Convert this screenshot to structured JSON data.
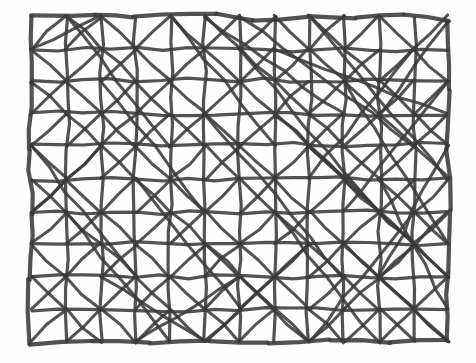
{
  "document": {
    "title": "Hand-drawn triangulated mesh sketch",
    "medium": "pencil-on-paper sketch",
    "background_color": "#fefefe",
    "ink_color": "#3a3a3a",
    "canvas": {
      "width": 476,
      "height": 363
    }
  },
  "drawing": {
    "name": "triangulated-grid-mesh",
    "description": "Rectangular hand-drawn grid of roughly 12 columns by 10 rows, with diagonal bracing lines inside most cells forming triangles, plus several long diagonals spanning many cells in the upper-right region.",
    "columns": 12,
    "rows": 10,
    "bounds": {
      "left": 31,
      "top": 16,
      "right": 448,
      "bottom": 342
    },
    "cell_width": 34.8,
    "cell_height": 32.6,
    "stroke_width_border": 4.2,
    "stroke_width_grid": 3.2,
    "stroke_width_diagonal": 3.0,
    "jitter_amplitude": 2.2
  },
  "chart_data": {
    "type": "diagram",
    "xlabel": "",
    "ylabel": "",
    "grid": true,
    "legend": "none",
    "border_polygon": [
      [
        31,
        16
      ],
      [
        96,
        14
      ],
      [
        133,
        17
      ],
      [
        216,
        13
      ],
      [
        253,
        20
      ],
      [
        308,
        16
      ],
      [
        356,
        18
      ],
      [
        404,
        15
      ],
      [
        448,
        22
      ],
      [
        449,
        90
      ],
      [
        447,
        150
      ],
      [
        450,
        210
      ],
      [
        448,
        272
      ],
      [
        447,
        340
      ],
      [
        390,
        342
      ],
      [
        330,
        340
      ],
      [
        268,
        343
      ],
      [
        210,
        341
      ],
      [
        150,
        343
      ],
      [
        92,
        341
      ],
      [
        30,
        344
      ],
      [
        29,
        280
      ],
      [
        32,
        215
      ],
      [
        29,
        150
      ],
      [
        32,
        84
      ]
    ],
    "vertical_lines_x": [
      31,
      66,
      101,
      136,
      170,
      205,
      240,
      275,
      309,
      344,
      379,
      414,
      448
    ],
    "horizontal_lines_y": [
      16,
      49,
      81,
      114,
      146,
      179,
      212,
      244,
      277,
      309,
      342
    ],
    "diagonals_note": "Most grid cells carry one diagonal; many carry both (X-bracing). Long multi-cell diagonals sweep through the upper-right quadrant.",
    "node_count_approx": 143,
    "edge_count_approx": 300
  }
}
